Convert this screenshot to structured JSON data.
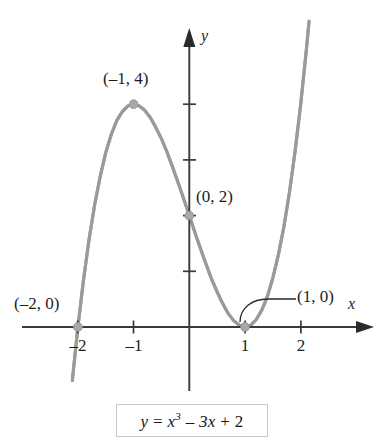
{
  "figure": {
    "background_color": "#ffffff",
    "curve_color": "#9a9a9a",
    "axis_color": "#3a3a3a",
    "point_color": "#a8a8a8",
    "equation_display": "y = x3 - 3x + 2",
    "equation_parts": {
      "lhs": "y",
      "equals": "=",
      "base": "x",
      "exponent": "3",
      "minus": "–",
      "middle_term": "3x",
      "plus": "+",
      "constant": "2"
    }
  },
  "axes": {
    "x_label": "x",
    "y_label": "y",
    "x_ticks": [
      {
        "value": -2,
        "label": "–2"
      },
      {
        "value": -1,
        "label": "–1"
      },
      {
        "value": 1,
        "label": "1"
      },
      {
        "value": 2,
        "label": "2"
      }
    ],
    "y_ticks": [
      {
        "value": 1,
        "label": ""
      },
      {
        "value": 2,
        "label": ""
      },
      {
        "value": 3,
        "label": ""
      },
      {
        "value": 4,
        "label": ""
      }
    ],
    "xlim": [
      -2.45,
      2.6
    ],
    "ylim": [
      -0.95,
      5.4
    ],
    "grid": false
  },
  "annotations": [
    {
      "name": "point-label-max",
      "text": "(–1, 4)",
      "x": -1,
      "y": 4
    },
    {
      "name": "point-label-yintercept",
      "text": "(0, 2)",
      "x": 0,
      "y": 2
    },
    {
      "name": "point-label-root-left",
      "text": "(–2, 0)",
      "x": -2,
      "y": 0
    },
    {
      "name": "point-label-root-right",
      "text": "(1, 0)",
      "x": 1,
      "y": 0
    }
  ],
  "chart_data": {
    "type": "line",
    "title": "",
    "xlabel": "x",
    "ylabel": "y",
    "xlim": [
      -2.45,
      2.6
    ],
    "ylim": [
      -0.95,
      5.4
    ],
    "grid": false,
    "legend": "none",
    "function": "y = x^3 - 3x + 2",
    "series": [
      {
        "name": "y = x^3 - 3x + 2",
        "color": "#9a9a9a",
        "x": [
          -2.45,
          -2.3,
          -2.2,
          -2.1,
          -2.0,
          -1.9,
          -1.8,
          -1.7,
          -1.6,
          -1.5,
          -1.4,
          -1.3,
          -1.2,
          -1.1,
          -1.0,
          -0.9,
          -0.8,
          -0.7,
          -0.6,
          -0.5,
          -0.4,
          -0.3,
          -0.2,
          -0.1,
          0.0,
          0.1,
          0.2,
          0.3,
          0.4,
          0.5,
          0.6,
          0.7,
          0.8,
          0.9,
          1.0,
          1.1,
          1.2,
          1.3,
          1.4,
          1.5,
          1.6,
          1.7,
          1.8,
          1.9,
          2.0,
          2.1,
          2.15
        ],
        "y": [
          -5.36,
          -3.27,
          -2.05,
          -0.96,
          0.0,
          0.84,
          1.57,
          2.19,
          2.7,
          3.13,
          3.46,
          3.71,
          3.87,
          3.97,
          4.0,
          3.97,
          3.89,
          3.76,
          3.58,
          3.38,
          3.14,
          2.87,
          2.59,
          2.3,
          2.0,
          1.7,
          1.41,
          1.13,
          0.86,
          0.63,
          0.42,
          0.24,
          0.11,
          0.03,
          0.0,
          0.03,
          0.13,
          0.3,
          0.54,
          0.88,
          1.3,
          1.81,
          2.43,
          3.16,
          4.0,
          4.96,
          5.49
        ]
      }
    ],
    "marked_points": [
      {
        "label": "(–2, 0)",
        "x": -2,
        "y": 0
      },
      {
        "label": "(–1, 4)",
        "x": -1,
        "y": 4
      },
      {
        "label": "(0, 2)",
        "x": 0,
        "y": 2
      },
      {
        "label": "(1, 0)",
        "x": 1,
        "y": 0
      }
    ]
  }
}
